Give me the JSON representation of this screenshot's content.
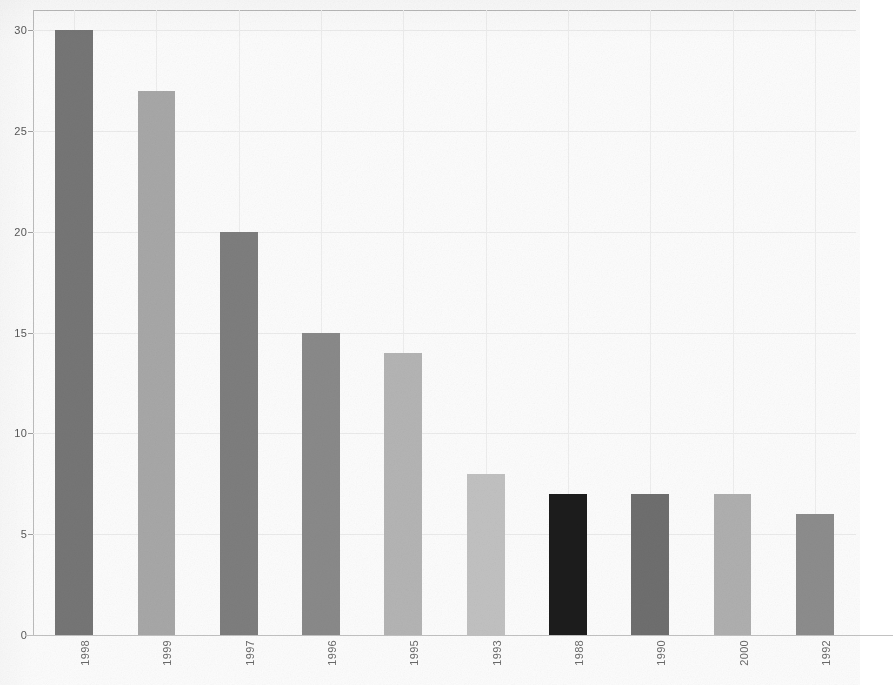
{
  "chart_data": {
    "type": "bar",
    "title": "",
    "subtitle": "",
    "xlabel": "",
    "ylabel": "",
    "categories": [
      "1998",
      "1999",
      "1997",
      "1996",
      "1995",
      "1993",
      "1988",
      "1990",
      "2000",
      "1992"
    ],
    "values": [
      30,
      27,
      20,
      15,
      14,
      8,
      7,
      7,
      7,
      6
    ],
    "bar_colors": [
      "#767676",
      "#a8a8a8",
      "#7e7e7e",
      "#8a8a8a",
      "#b5b5b5",
      "#c2c2c2",
      "#1c1c1c",
      "#6f6f6f",
      "#b0b0b0",
      "#8d8d8d"
    ],
    "ylim": [
      0,
      31
    ],
    "yticks": [
      0,
      5,
      10,
      15,
      20,
      25,
      30
    ],
    "ytick_labels": [
      "0",
      "5",
      "10",
      "15",
      "20",
      "25",
      "30"
    ],
    "grid": true,
    "grid_color": "#ececec",
    "legend": "none",
    "axis_color": "#b9b9b9",
    "background": "#ffffff",
    "tick_label_color": "#585858",
    "xtick_rotation": 90
  }
}
